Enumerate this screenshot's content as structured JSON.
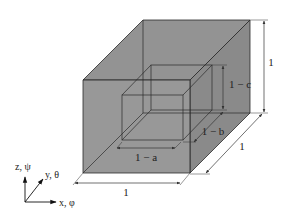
{
  "figure": {
    "colors": {
      "fill": "#8f8f8f",
      "fill_side": "#8a8a8a",
      "fill_top": "#939393",
      "edge": "#2a2a2a",
      "dimension": "#333333",
      "background": "#ffffff"
    },
    "outer_cube": {
      "width_label": "1",
      "depth_label": "1",
      "height_label": "1"
    },
    "inner_cube": {
      "width_label": "1 − a",
      "depth_label": "1 − b",
      "height_label": "1 − c"
    },
    "axes": {
      "z_label": "z, ψ",
      "y_label": "y, θ",
      "x_label": "x, φ"
    }
  }
}
